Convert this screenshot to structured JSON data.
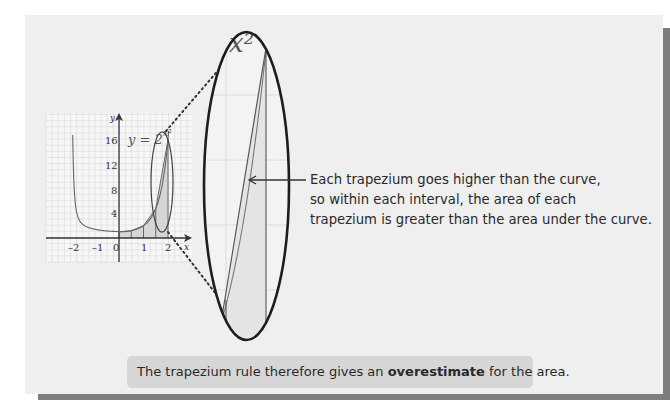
{
  "figure": {
    "curve_label": "y = 2",
    "curve_label_exponent": "x²",
    "zoom_label": "x²",
    "axis_x_label": "x",
    "axis_y_label": "y",
    "x_ticks": [
      "–2",
      "–1",
      "0",
      "1",
      "2"
    ],
    "y_ticks": [
      "4",
      "8",
      "12",
      "16"
    ],
    "trapezium_strips_x": [
      0,
      0.5,
      1,
      1.5,
      2
    ]
  },
  "callout": {
    "lines": [
      "Each trapezium goes higher than the curve,",
      "so within each interval, the area of each",
      "trapezium is greater than the area under the curve."
    ]
  },
  "caption": {
    "before": "The trapezium rule therefore gives an ",
    "bold": "overestimate",
    "after": " for the area."
  }
}
